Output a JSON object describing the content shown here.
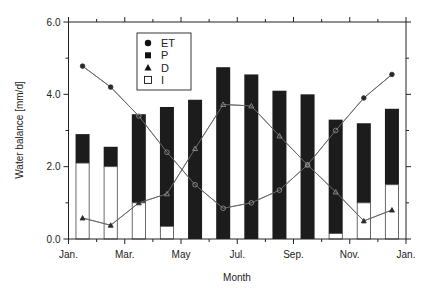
{
  "chart_data": {
    "type": "bar",
    "title": "",
    "xlabel": "Month",
    "ylabel": "Water balance [mm/d]",
    "ylim": [
      0,
      6
    ],
    "yticks": [
      "0.0",
      "2.0",
      "4.0",
      "6.0"
    ],
    "xticks": [
      "Jan.",
      "Mar.",
      "May",
      "Jul.",
      "Sep.",
      "Nov.",
      "Jan."
    ],
    "categories": [
      "Jan",
      "Feb",
      "Mar",
      "Apr",
      "May",
      "Jun",
      "Jul",
      "Aug",
      "Sep",
      "Oct",
      "Nov",
      "Dec"
    ],
    "grid": false,
    "legend_position": "upper-left-inside",
    "series": [
      {
        "name": "ET",
        "type": "line",
        "marker": "circle",
        "values": [
          4.78,
          4.2,
          3.4,
          2.4,
          1.5,
          0.85,
          1.0,
          1.35,
          2.05,
          3.0,
          3.9,
          4.55
        ]
      },
      {
        "name": "P",
        "type": "bar-stacked-total",
        "marker": "filled-square",
        "values": [
          2.9,
          2.55,
          3.45,
          3.65,
          3.85,
          4.75,
          4.55,
          4.1,
          4.0,
          3.3,
          3.2,
          3.6
        ]
      },
      {
        "name": "D",
        "type": "line",
        "marker": "triangle",
        "values": [
          0.58,
          0.38,
          1.0,
          1.25,
          2.5,
          3.72,
          3.68,
          2.85,
          2.05,
          1.3,
          0.5,
          0.8
        ]
      },
      {
        "name": "I",
        "type": "bar-lower",
        "marker": "open-square",
        "values": [
          2.1,
          2.0,
          1.0,
          0.35,
          0.0,
          0.0,
          0.0,
          0.0,
          0.0,
          0.15,
          1.0,
          1.5
        ]
      }
    ]
  },
  "legend": {
    "items": [
      {
        "label": "ET",
        "symbol": "circle"
      },
      {
        "label": "P",
        "symbol": "filled-square"
      },
      {
        "label": "D",
        "symbol": "triangle"
      },
      {
        "label": "I",
        "symbol": "open-square"
      }
    ]
  },
  "axes": {
    "ylabel": "Water balance [mm/d]",
    "xlabel": "Month"
  },
  "colors": {
    "bar_fill": "#1c1c1c",
    "irrigation_fill": "#ffffff",
    "line": "#2a2a2a",
    "line_over_bar": "#9a9a9a",
    "axis": "#222222"
  }
}
